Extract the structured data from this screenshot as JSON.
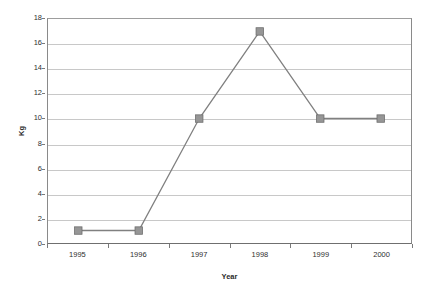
{
  "chart_data": {
    "type": "line",
    "title": "",
    "subtitle": "",
    "xlabel": "Year",
    "ylabel": "Kg",
    "categories": [
      "1995",
      "1996",
      "1997",
      "1998",
      "1999",
      "2000"
    ],
    "values": [
      1,
      1,
      10,
      17,
      10,
      10
    ],
    "series": [
      {
        "name": "Kg",
        "values": [
          1,
          1,
          10,
          17,
          10,
          10
        ]
      }
    ],
    "ylim": [
      0,
      18
    ],
    "ytick_labels": [
      "0",
      "2",
      "4",
      "6",
      "8",
      "10",
      "12",
      "14",
      "16",
      "18"
    ],
    "ytick_values": [
      0,
      2,
      4,
      6,
      8,
      10,
      12,
      14,
      16,
      18
    ],
    "xtick_labels": [
      "1995",
      "1996",
      "1997",
      "1998",
      "1999",
      "2000"
    ],
    "grid": {
      "horizontal": true,
      "vertical": false
    },
    "legend": {
      "visible": false,
      "position": "none"
    },
    "marker": "square",
    "colors": {
      "line": "#808080",
      "marker_fill": "#969696",
      "marker_edge": "#6e6e6e",
      "gridline": "#c8c8c8",
      "axis": "#7a7a7a",
      "text": "#2f2f2f",
      "background": "#ffffff"
    }
  }
}
